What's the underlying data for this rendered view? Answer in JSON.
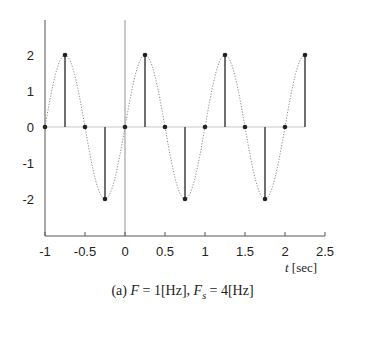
{
  "chart_data": {
    "type": "line",
    "title": "",
    "caption": "(a) F = 1[Hz], Fs = 4[Hz]",
    "xlabel": "t [sec]",
    "ylabel": "",
    "xlim": [
      -1,
      2.5
    ],
    "ylim": [
      -3,
      3
    ],
    "x_ticks": [
      "-1",
      "-0.5",
      "0",
      "0.5",
      "1",
      "1.5",
      "2",
      "2.5"
    ],
    "y_ticks": [
      "2",
      "1",
      "0",
      "-1",
      "-2"
    ],
    "grid": false,
    "legend": null,
    "series": [
      {
        "name": "continuous signal",
        "style": "dotted",
        "function": "2*sin(2*pi*t)",
        "frequency_hz": 1,
        "amplitude": 2
      },
      {
        "name": "samples",
        "style": "stem",
        "x": [
          -1,
          -0.75,
          -0.5,
          -0.25,
          0,
          0.25,
          0.5,
          0.75,
          1,
          1.25,
          1.5,
          1.75,
          2,
          2.25
        ],
        "values": [
          0,
          2,
          0,
          -2,
          0,
          2,
          0,
          -2,
          0,
          2,
          0,
          -2,
          0,
          2
        ]
      }
    ],
    "sampling_rate_hz": 4
  },
  "caption": {
    "prefix": "(a) ",
    "F": "F",
    "F_val": " = 1[Hz], ",
    "Fs": "F",
    "Fs_sub": "s",
    "Fs_val": " = 4[Hz]"
  },
  "axes": {
    "xlabel_t": "t",
    "xlabel_unit": " [sec]"
  }
}
